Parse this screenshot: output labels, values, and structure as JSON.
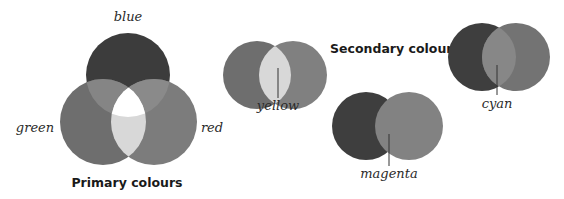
{
  "primary": {
    "title": "Primary colours",
    "labels": {
      "blue": "blue",
      "green": "green",
      "red": "red"
    },
    "colors": {
      "blue": "#3c3c3c",
      "green": "#6e6e6e",
      "red": "#7c7c7c",
      "blue_green": "#858585",
      "blue_red": "#8a8a8a",
      "green_red": "#d8d8d8",
      "white": "#ffffff"
    }
  },
  "secondary": {
    "title": "Secondary colours",
    "yellow": {
      "label": "yellow",
      "left": "#6e6e6e",
      "right": "#808080",
      "overlap": "#d8d8d8"
    },
    "cyan": {
      "label": "cyan",
      "left": "#3e3e3e",
      "right": "#737373",
      "overlap": "#878787"
    },
    "magenta": {
      "label": "magenta",
      "left": "#3e3e3e",
      "right": "#828282",
      "overlap": "#828282"
    }
  }
}
